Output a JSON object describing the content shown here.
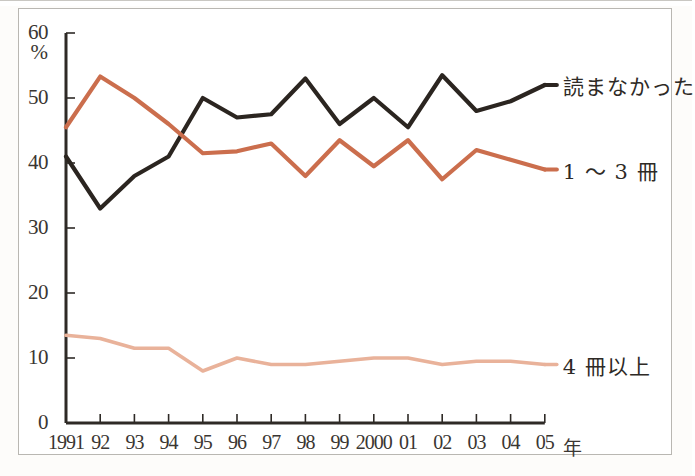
{
  "axis": {
    "y_unit": "%",
    "y_ticks": [
      "0",
      "10",
      "20",
      "30",
      "40",
      "50",
      "60"
    ],
    "x_unit": "年",
    "x_ticks": [
      "1991",
      "92",
      "93",
      "94",
      "95",
      "96",
      "97",
      "98",
      "99",
      "2000",
      "01",
      "02",
      "03",
      "04",
      "05"
    ]
  },
  "legend": {
    "series1": "読まなかった",
    "series2": "1 〜 3 冊",
    "series3": "4 冊以上"
  },
  "colors": {
    "series1": "#2b2520",
    "series2": "#cb6e4d",
    "series3": "#e9b29a",
    "axis": "#2e2a26",
    "border": "#b9b7b2",
    "background": "#ffffff"
  },
  "chart_data": {
    "type": "line",
    "title": "",
    "xlabel": "年",
    "ylabel": "%",
    "ylim": [
      0,
      60
    ],
    "grid": false,
    "legend_position": "right",
    "categories": [
      "1991",
      "92",
      "93",
      "94",
      "95",
      "96",
      "97",
      "98",
      "99",
      "2000",
      "01",
      "02",
      "03",
      "04",
      "05"
    ],
    "series": [
      {
        "name": "読まなかった",
        "color": "#2b2520",
        "values": [
          41,
          33,
          38,
          41,
          50,
          47,
          47.5,
          53,
          46,
          50,
          45.5,
          53.5,
          48,
          49.5,
          52
        ]
      },
      {
        "name": "1 〜 3 冊",
        "color": "#cb6e4d",
        "values": [
          45.5,
          53.3,
          50,
          46,
          41.5,
          41.8,
          43,
          38,
          43.5,
          39.5,
          43.5,
          37.5,
          42,
          40.5,
          39
        ]
      },
      {
        "name": "4 冊以上",
        "color": "#e9b29a",
        "values": [
          13.5,
          13,
          11.5,
          11.5,
          8,
          10,
          9,
          9,
          9.5,
          10,
          10,
          9,
          9.5,
          9.5,
          9
        ]
      }
    ]
  }
}
